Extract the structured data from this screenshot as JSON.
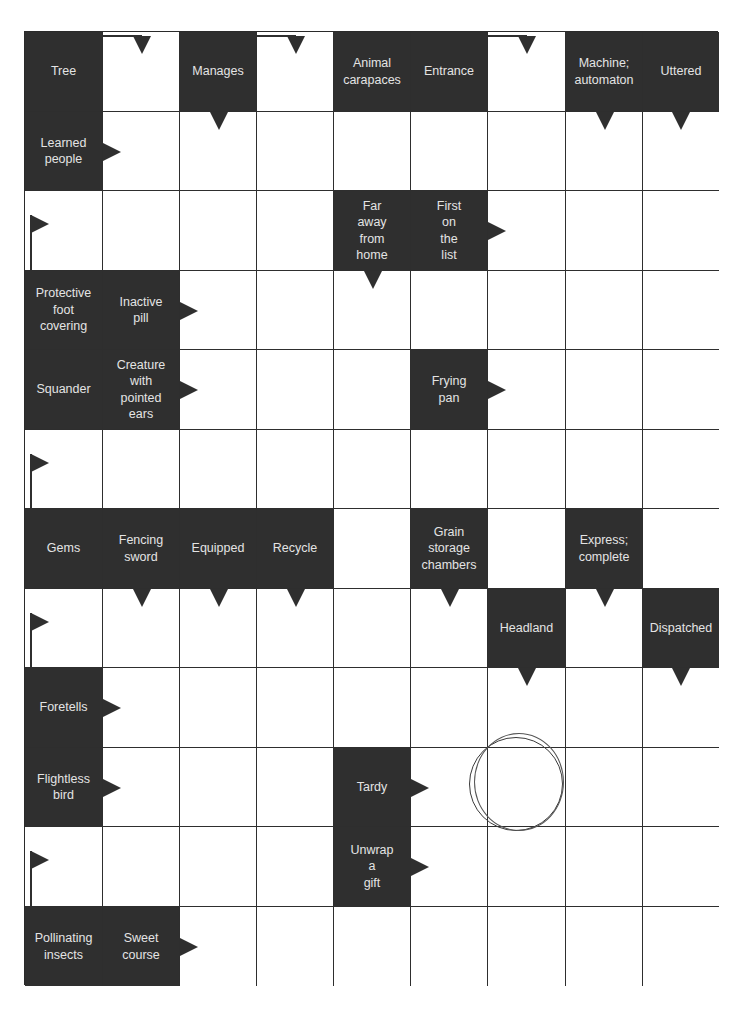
{
  "puzzle": {
    "type": "arrowword",
    "columns": 9,
    "rows": 12,
    "colors": {
      "clue_bg": "#2f2f2f",
      "clue_text": "#e4e4e4",
      "grid_line": "#2e2e2e",
      "cell_bg": "#ffffff"
    },
    "clues": [
      {
        "id": "c0_0",
        "row": 0,
        "col": 0,
        "text": "Tree"
      },
      {
        "id": "c0_2",
        "row": 0,
        "col": 2,
        "text": "Manages"
      },
      {
        "id": "c0_4",
        "row": 0,
        "col": 4,
        "text": "Animal\ncarapaces"
      },
      {
        "id": "c0_5",
        "row": 0,
        "col": 5,
        "text": "Entrance"
      },
      {
        "id": "c0_7",
        "row": 0,
        "col": 7,
        "text": "Machine;\nautomaton"
      },
      {
        "id": "c0_8",
        "row": 0,
        "col": 8,
        "text": "Uttered"
      },
      {
        "id": "c1_0",
        "row": 1,
        "col": 0,
        "text": "Learned\npeople"
      },
      {
        "id": "c2_4",
        "row": 2,
        "col": 4,
        "text": "Far\naway\nfrom\nhome"
      },
      {
        "id": "c2_5",
        "row": 2,
        "col": 5,
        "text": "First\non\nthe\nlist"
      },
      {
        "id": "c3_0",
        "row": 3,
        "col": 0,
        "text": "Protective\nfoot\ncovering"
      },
      {
        "id": "c3_1",
        "row": 3,
        "col": 1,
        "text": "Inactive\npill"
      },
      {
        "id": "c4_0",
        "row": 4,
        "col": 0,
        "text": "Squander"
      },
      {
        "id": "c4_1",
        "row": 4,
        "col": 1,
        "text": "Creature\nwith\npointed\nears"
      },
      {
        "id": "c4_5",
        "row": 4,
        "col": 5,
        "text": "Frying\npan"
      },
      {
        "id": "c6_0",
        "row": 6,
        "col": 0,
        "text": "Gems"
      },
      {
        "id": "c6_1",
        "row": 6,
        "col": 1,
        "text": "Fencing\nsword"
      },
      {
        "id": "c6_2",
        "row": 6,
        "col": 2,
        "text": "Equipped"
      },
      {
        "id": "c6_3",
        "row": 6,
        "col": 3,
        "text": "Recycle"
      },
      {
        "id": "c6_5",
        "row": 6,
        "col": 5,
        "text": "Grain\nstorage\nchambers"
      },
      {
        "id": "c6_7",
        "row": 6,
        "col": 7,
        "text": "Express;\ncomplete"
      },
      {
        "id": "c7_6",
        "row": 7,
        "col": 6,
        "text": "Headland"
      },
      {
        "id": "c7_8",
        "row": 7,
        "col": 8,
        "text": "Dispatched"
      },
      {
        "id": "c8_0",
        "row": 8,
        "col": 0,
        "text": "Foretells"
      },
      {
        "id": "c9_0",
        "row": 9,
        "col": 0,
        "text": "Flightless\nbird"
      },
      {
        "id": "c9_4",
        "row": 9,
        "col": 4,
        "text": "Tardy"
      },
      {
        "id": "c10_4",
        "row": 10,
        "col": 4,
        "text": "Unwrap\na\ngift"
      },
      {
        "id": "c11_0",
        "row": 11,
        "col": 0,
        "text": "Pollinating\ninsects"
      },
      {
        "id": "c11_1",
        "row": 11,
        "col": 1,
        "text": "Sweet\ncourse"
      }
    ],
    "arrows": [
      {
        "type": "down",
        "row": 0,
        "col": 1,
        "pos": "top",
        "elbow": "from-left"
      },
      {
        "type": "down",
        "row": 0,
        "col": 3,
        "pos": "top",
        "elbow": "from-left"
      },
      {
        "type": "down",
        "row": 0,
        "col": 6,
        "pos": "top",
        "elbow": "from-left"
      },
      {
        "type": "down",
        "row": 1,
        "col": 2,
        "pos": "top"
      },
      {
        "type": "down",
        "row": 1,
        "col": 7,
        "pos": "top"
      },
      {
        "type": "down",
        "row": 1,
        "col": 8,
        "pos": "top"
      },
      {
        "type": "right",
        "row": 1,
        "col": 1,
        "pos": "left"
      },
      {
        "type": "right",
        "row": 2,
        "col": 0,
        "pos": "flag"
      },
      {
        "type": "down",
        "row": 3,
        "col": 4,
        "pos": "top"
      },
      {
        "type": "right",
        "row": 2,
        "col": 6,
        "pos": "left"
      },
      {
        "type": "right",
        "row": 3,
        "col": 2,
        "pos": "left"
      },
      {
        "type": "right",
        "row": 4,
        "col": 2,
        "pos": "left"
      },
      {
        "type": "right",
        "row": 4,
        "col": 6,
        "pos": "left"
      },
      {
        "type": "right",
        "row": 5,
        "col": 0,
        "pos": "flag"
      },
      {
        "type": "down",
        "row": 7,
        "col": 1,
        "pos": "top"
      },
      {
        "type": "down",
        "row": 7,
        "col": 2,
        "pos": "top"
      },
      {
        "type": "down",
        "row": 7,
        "col": 3,
        "pos": "top"
      },
      {
        "type": "down",
        "row": 7,
        "col": 5,
        "pos": "top"
      },
      {
        "type": "down",
        "row": 7,
        "col": 7,
        "pos": "top"
      },
      {
        "type": "right",
        "row": 7,
        "col": 0,
        "pos": "flag"
      },
      {
        "type": "down",
        "row": 8,
        "col": 6,
        "pos": "top"
      },
      {
        "type": "down",
        "row": 8,
        "col": 8,
        "pos": "top"
      },
      {
        "type": "right",
        "row": 8,
        "col": 1,
        "pos": "left"
      },
      {
        "type": "right",
        "row": 9,
        "col": 1,
        "pos": "left"
      },
      {
        "type": "right",
        "row": 9,
        "col": 5,
        "pos": "left"
      },
      {
        "type": "right",
        "row": 10,
        "col": 5,
        "pos": "left"
      },
      {
        "type": "right",
        "row": 10,
        "col": 0,
        "pos": "flag"
      },
      {
        "type": "right",
        "row": 11,
        "col": 2,
        "pos": "left"
      }
    ],
    "highlight_circle": {
      "row": 9,
      "col": 6
    }
  }
}
